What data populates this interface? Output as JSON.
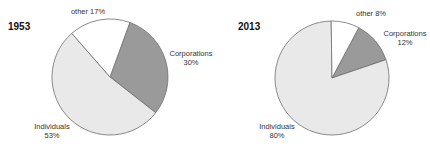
{
  "chart_data": [
    {
      "type": "pie",
      "title": "1953",
      "categories": [
        "Corporations",
        "Individuals",
        "other"
      ],
      "values": [
        30,
        53,
        17
      ],
      "labels": [
        "Corporations\n30%",
        "Individuals\n53%",
        "other 17%"
      ],
      "colors": [
        "#9a9a9a",
        "#e9e9e9",
        "#ffffff"
      ],
      "start_angle_deg": 20,
      "direction": "clockwise",
      "legend": "none (direct labels)"
    },
    {
      "type": "pie",
      "title": "2013",
      "categories": [
        "Corporations",
        "Individuals",
        "other"
      ],
      "values": [
        12,
        80,
        8
      ],
      "labels": [
        "Corporations\n12%",
        "Individuals\n80%",
        "other 8%"
      ],
      "colors": [
        "#9a9a9a",
        "#e9e9e9",
        "#ffffff"
      ],
      "start_angle_deg": 28,
      "direction": "clockwise",
      "legend": "none (direct labels)"
    }
  ],
  "pies": [
    {
      "year": "1953",
      "cx": 110,
      "cy": 77,
      "r": 58,
      "labels": {
        "other": {
          "line1": "other 17%",
          "line2": ""
        },
        "corporations": {
          "line1": "Corporations",
          "line2": "30%"
        },
        "individuals": {
          "line1": "Individuals",
          "line2": "53%"
        }
      }
    },
    {
      "year": "2013",
      "cx": 332,
      "cy": 78,
      "r": 57,
      "labels": {
        "other": {
          "line1": "other 8%",
          "line2": ""
        },
        "corporations": {
          "line1": "Corporations",
          "line2": "12%"
        },
        "individuals": {
          "line1": "Individuals",
          "line2": "80%"
        }
      }
    }
  ]
}
